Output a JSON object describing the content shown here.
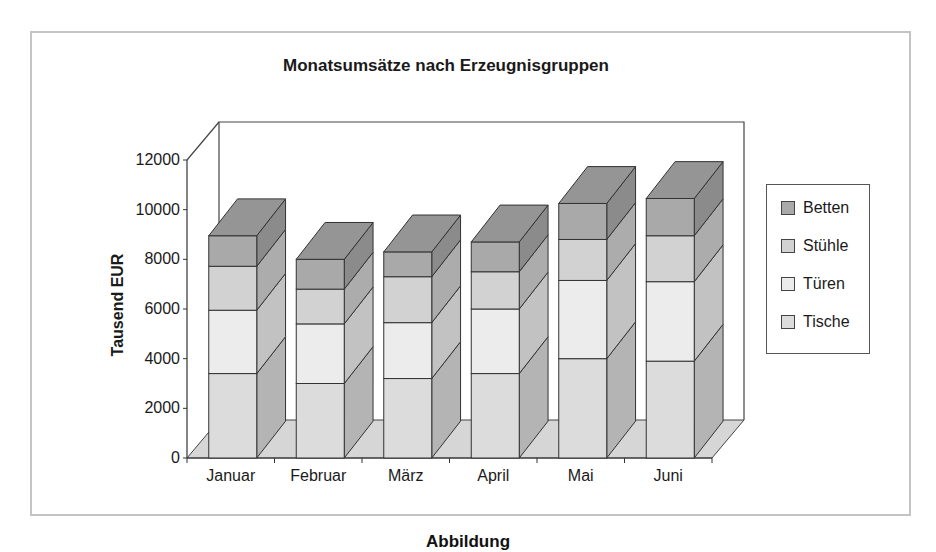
{
  "chart_data": {
    "type": "bar",
    "subtype": "stacked-3d",
    "title": "Monatsumsätze nach Erzeugnisgruppen",
    "xlabel": "",
    "ylabel": "Tausend EUR",
    "ylim": [
      0,
      12000
    ],
    "yticks": [
      "0",
      "2000",
      "4000",
      "6000",
      "8000",
      "10000",
      "12000"
    ],
    "categories": [
      "Januar",
      "Februar",
      "März",
      "April",
      "Mai",
      "Juni"
    ],
    "series": [
      {
        "name": "Tische",
        "color": "#dcdcdc",
        "values": [
          3400,
          3000,
          3200,
          3400,
          4000,
          3900
        ]
      },
      {
        "name": "Türen",
        "color": "#ececec",
        "values": [
          2550,
          2400,
          2250,
          2600,
          3150,
          3200
        ]
      },
      {
        "name": "Stühle",
        "color": "#d2d2d2",
        "values": [
          1770,
          1400,
          1850,
          1500,
          1650,
          1850
        ]
      },
      {
        "name": "Betten",
        "color": "#a9a9a9",
        "values": [
          1230,
          1200,
          1000,
          1200,
          1450,
          1500
        ]
      }
    ],
    "legend": {
      "position": "right",
      "entries": [
        "Betten",
        "Stühle",
        "Türen",
        "Tische"
      ]
    },
    "grid": false
  },
  "caption": "Abbildung"
}
